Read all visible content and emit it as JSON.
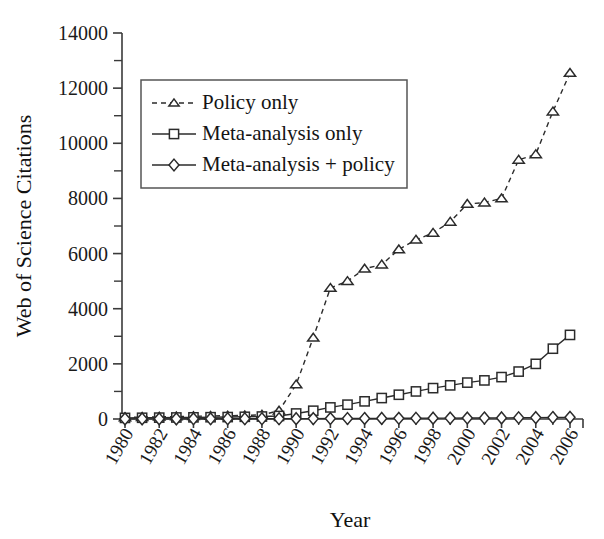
{
  "chart_data": {
    "type": "line",
    "title": "",
    "xlabel": "Year",
    "ylabel": "Web of Science Citations",
    "xlim": [
      1980,
      2006
    ],
    "ylim": [
      0,
      14000
    ],
    "grid": false,
    "legend_position": "upper-left-inside",
    "y_major_ticks": [
      0,
      2000,
      4000,
      6000,
      8000,
      10000,
      12000,
      14000
    ],
    "y_minor_ticks": [
      1000,
      3000,
      5000,
      7000,
      9000,
      11000,
      13000
    ],
    "y_tick_labels": [
      "0",
      "2000",
      "4000",
      "6000",
      "8000",
      "10000",
      "12000",
      "14000"
    ],
    "x": [
      1980,
      1981,
      1982,
      1983,
      1984,
      1985,
      1986,
      1987,
      1988,
      1989,
      1990,
      1991,
      1992,
      1993,
      1994,
      1995,
      1996,
      1997,
      1998,
      1999,
      2000,
      2001,
      2002,
      2003,
      2004,
      2005,
      2006
    ],
    "x_tick_labels": [
      "1980",
      "1982",
      "1984",
      "1986",
      "1988",
      "1990",
      "1992",
      "1994",
      "1996",
      "1998",
      "2000",
      "2002",
      "2004",
      "2006"
    ],
    "x_tick_label_values": [
      1980,
      1982,
      1984,
      1986,
      1988,
      1990,
      1992,
      1994,
      1996,
      1998,
      2000,
      2002,
      2004,
      2006
    ],
    "series": [
      {
        "name": "Policy only",
        "marker": "triangle",
        "linestyle": "dashed",
        "color": "#2b2b2b",
        "values": [
          60,
          70,
          80,
          90,
          100,
          110,
          120,
          130,
          150,
          300,
          1250,
          2950,
          4750,
          5000,
          5450,
          5600,
          6150,
          6500,
          6750,
          7150,
          7800,
          7850,
          8000,
          9400,
          9600,
          11150,
          12550
        ]
      },
      {
        "name": "Meta-analysis only",
        "marker": "square",
        "linestyle": "solid",
        "color": "#2b2b2b",
        "values": [
          40,
          45,
          50,
          55,
          60,
          65,
          70,
          80,
          90,
          110,
          200,
          300,
          420,
          520,
          640,
          760,
          880,
          1000,
          1120,
          1220,
          1320,
          1400,
          1520,
          1720,
          2000,
          2550,
          3050
        ]
      },
      {
        "name": "Meta-analysis + policy",
        "marker": "diamond",
        "linestyle": "solid",
        "color": "#2b2b2b",
        "values": [
          5,
          5,
          6,
          6,
          7,
          7,
          8,
          8,
          9,
          10,
          12,
          14,
          16,
          18,
          20,
          22,
          25,
          27,
          30,
          32,
          35,
          37,
          40,
          45,
          50,
          55,
          60
        ]
      }
    ]
  },
  "legend": {
    "items": [
      {
        "label": "Policy only",
        "marker": "triangle",
        "linestyle": "dashed"
      },
      {
        "label": "Meta-analysis only",
        "marker": "square",
        "linestyle": "solid"
      },
      {
        "label": "Meta-analysis + policy",
        "marker": "diamond",
        "linestyle": "solid"
      }
    ]
  }
}
